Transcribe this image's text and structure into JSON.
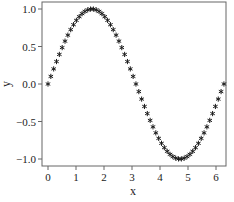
{
  "chart_data": {
    "type": "scatter",
    "title": "",
    "xlabel": "x",
    "ylabel": "y",
    "xlim": [
      -0.2,
      6.45
    ],
    "ylim": [
      -1.08,
      1.1
    ],
    "xticks": [
      0,
      1,
      2,
      3,
      4,
      5,
      6
    ],
    "xtick_labels": [
      "0",
      "1",
      "2",
      "3",
      "4",
      "5",
      "6"
    ],
    "yticks": [
      -1.0,
      -0.5,
      0.0,
      0.5,
      1.0
    ],
    "ytick_labels": [
      "−1.0",
      "−0.5",
      "0.0",
      "0.5",
      "1.0"
    ],
    "grid": false,
    "legend": null,
    "series": [
      {
        "name": "sin(x)",
        "marker": "asterisk",
        "color": "#1a1a1a",
        "function": "sin(x)",
        "x_start": 0.0,
        "x_end": 6.2832,
        "num_points": 63
      }
    ]
  },
  "colors": {
    "background": "#ffffff",
    "axis": "#555555",
    "marker": "#1a1a1a",
    "text": "#222222"
  }
}
